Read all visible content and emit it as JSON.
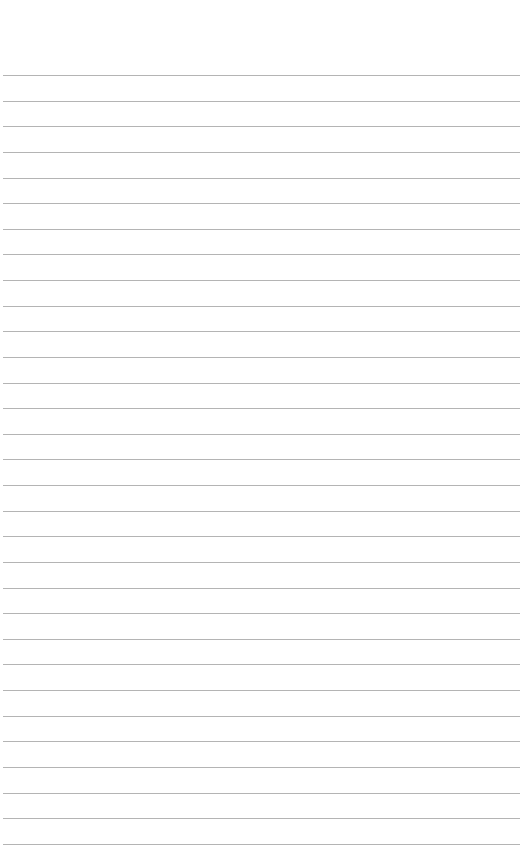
{
  "page": {
    "type": "lined-paper",
    "background": "#ffffff",
    "rule_color": "#b4b4b4",
    "rule_count": 31,
    "first_rule_y": 75,
    "rule_spacing": 25.63
  }
}
